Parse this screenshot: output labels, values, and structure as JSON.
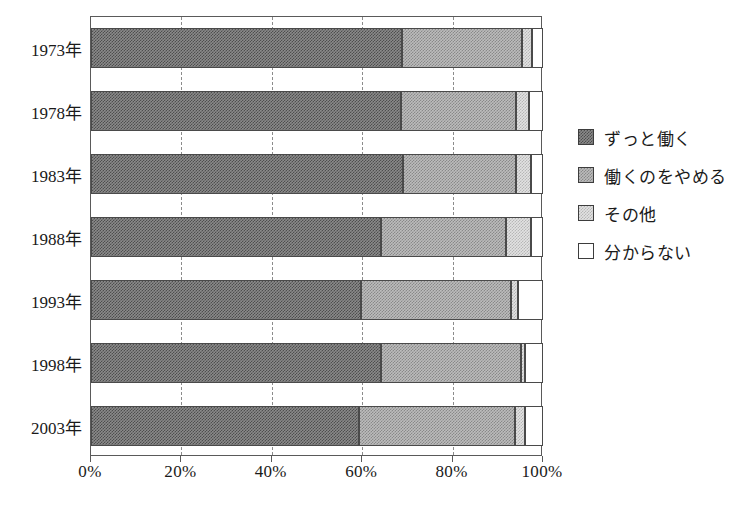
{
  "chart_data": {
    "type": "bar",
    "orientation": "horizontal",
    "stacked": true,
    "normalized_percent": true,
    "title": "",
    "xlabel": "",
    "ylabel": "",
    "xlim": [
      0,
      100
    ],
    "grid": true,
    "legend_position": "right",
    "categories": [
      "1973年",
      "1978年",
      "1983年",
      "1988年",
      "1993年",
      "1998年",
      "2003年"
    ],
    "x_ticks": [
      "0%",
      "20%",
      "40%",
      "60%",
      "80%",
      "100%"
    ],
    "x_tick_values": [
      0,
      20,
      40,
      60,
      80,
      100
    ],
    "series": [
      {
        "name": "ずっと働く",
        "swatch": "dark-gray-dither",
        "values": [
          68.8,
          68.6,
          69.0,
          64.2,
          59.7,
          64.2,
          59.3
        ]
      },
      {
        "name": "働くのをやめる",
        "swatch": "mid-gray-dither",
        "values": [
          26.6,
          25.4,
          25.0,
          27.6,
          33.2,
          30.9,
          34.5
        ]
      },
      {
        "name": "その他",
        "swatch": "light-gray-dither",
        "values": [
          2.2,
          2.9,
          3.3,
          5.5,
          1.6,
          0.9,
          2.2
        ]
      },
      {
        "name": "分からない",
        "swatch": "white",
        "values": [
          2.4,
          3.1,
          2.7,
          2.7,
          5.5,
          4.0,
          4.0
        ]
      }
    ]
  },
  "legend": {
    "items": [
      {
        "label": "ずっと働く"
      },
      {
        "label": "働くのをやめる"
      },
      {
        "label": "その他"
      },
      {
        "label": "分からない"
      }
    ]
  },
  "colors": {
    "series_0": "#8a8a8a",
    "series_1": "#bcbcbc",
    "series_2": "#e2e2e2",
    "series_3": "#ffffff",
    "axis": "#5a5a5a",
    "gridline": "#8c8c8c",
    "text": "#1a1a1a",
    "background": "#ffffff"
  }
}
